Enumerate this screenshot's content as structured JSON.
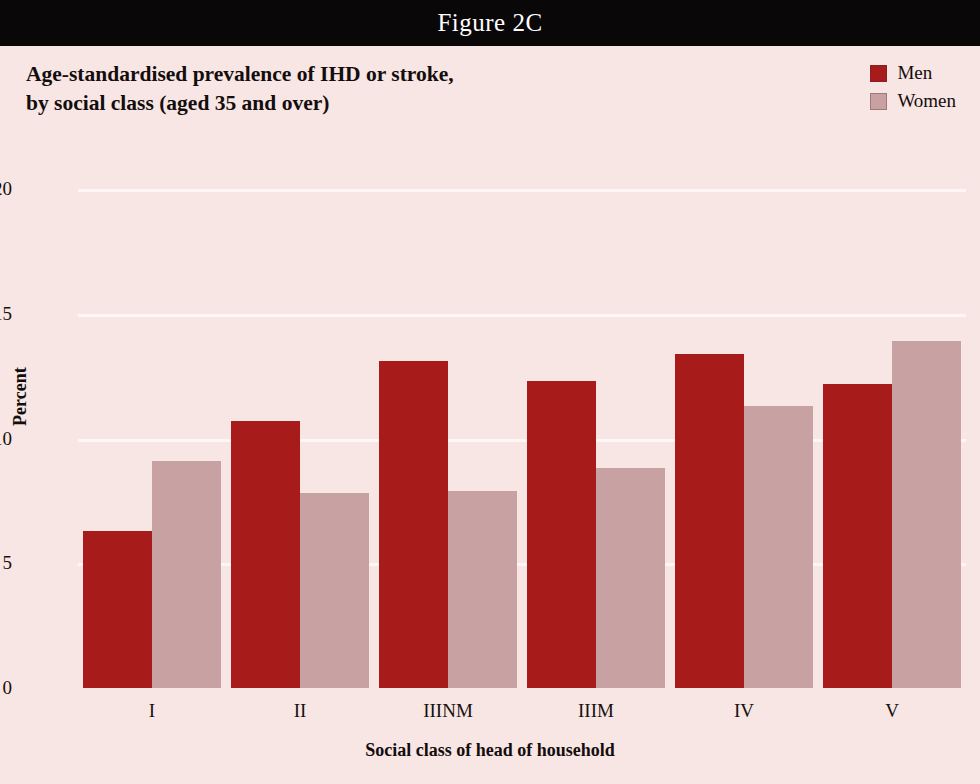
{
  "figure": {
    "band_label": "Figure 2C",
    "band_bg": "#0a0708",
    "band_text_color": "#ffffff",
    "panel_bg": "#f7e6e3"
  },
  "title": {
    "line1": "Age-standardised prevalence of IHD or stroke,",
    "line2": "by social class (aged 35 and over)"
  },
  "legend": {
    "position": "top-right",
    "items": [
      {
        "label": "Men",
        "color": "#a81b1b"
      },
      {
        "label": "Women",
        "color": "#c8a1a2"
      }
    ]
  },
  "chart_data": {
    "type": "bar",
    "title": "Age-standardised prevalence of IHD or stroke, by social class (aged 35 and over)",
    "xlabel": "Social class of head of household",
    "ylabel": "Percent",
    "categories": [
      "I",
      "II",
      "IIINM",
      "IIIM",
      "IV",
      "V"
    ],
    "series": [
      {
        "name": "Men",
        "color": "#a81b1b",
        "values": [
          6.3,
          10.7,
          13.1,
          12.3,
          13.4,
          12.2
        ]
      },
      {
        "name": "Women",
        "color": "#c8a1a2",
        "values": [
          9.1,
          7.8,
          7.9,
          8.8,
          11.3,
          13.9
        ]
      }
    ],
    "ylim": [
      0,
      20
    ],
    "yticks": [
      0,
      5,
      10,
      15,
      20
    ],
    "ytick_labels": [
      "0",
      "5",
      "10",
      "15",
      "20"
    ],
    "grid": "horizontal",
    "gridline_color": "#fdf6f4",
    "legend_position": "top-right",
    "bar_grouping": "adjacent-pairs"
  }
}
